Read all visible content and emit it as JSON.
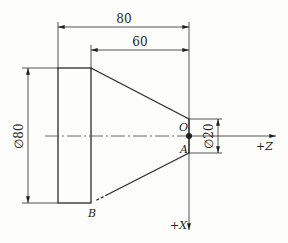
{
  "drawing": {
    "title": "Turned part with taper and coordinate system",
    "dimensions": {
      "total_length": "80",
      "taper_length": "60",
      "large_diameter": "∅80",
      "small_diameter": "∅20"
    },
    "points": {
      "origin": "O",
      "point_a": "A",
      "point_b": "B"
    },
    "axes": {
      "z_label": "+Z",
      "x_label": "+X"
    },
    "line_color": "#2a2a2a"
  }
}
